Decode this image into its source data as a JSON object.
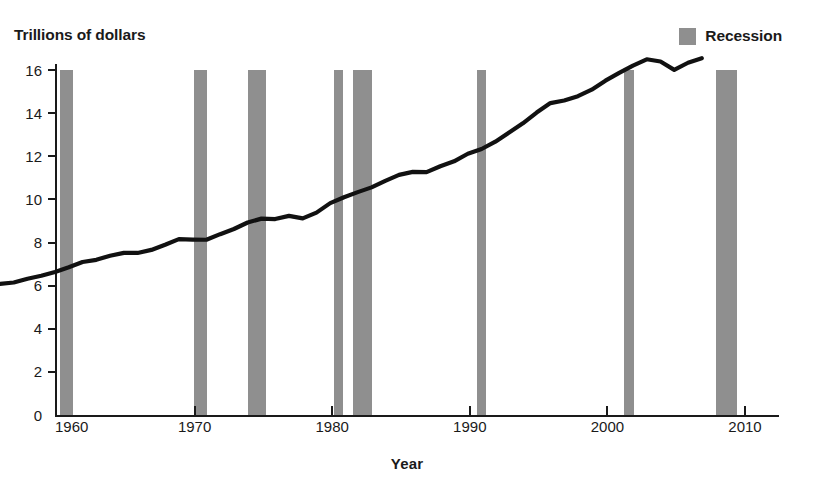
{
  "top_caption_sliver": "",
  "legend": {
    "items": [
      {
        "label": "Recession",
        "swatch_color": "#8f8f8f",
        "icon": "filled-square-icon"
      }
    ]
  },
  "axis_titles": {
    "y": "Trillions of dollars",
    "x": "Year"
  },
  "colors": {
    "line": "#111111",
    "recession": "#8f8f8f",
    "axis": "#1a1a1a",
    "background": "#ffffff"
  },
  "chart_data": {
    "type": "line",
    "title": "",
    "subtitle": "",
    "xlabel": "Year",
    "ylabel": "Trillions of dollars",
    "xlim": [
      1960,
      2011.5
    ],
    "ylim": [
      0,
      16
    ],
    "grid": false,
    "legend_position": "top-right",
    "x_ticks": [
      1960,
      1970,
      1980,
      1990,
      2000,
      2010
    ],
    "x_tick_labels": [
      "1960",
      "1970",
      "1980",
      "1990",
      "2000",
      "2010"
    ],
    "y_ticks": [
      0,
      2,
      4,
      6,
      8,
      10,
      12,
      14,
      16
    ],
    "y_tick_labels": [
      "0",
      "2",
      "4",
      "6",
      "8",
      "10",
      "12",
      "14",
      "16"
    ],
    "series": [
      {
        "name": "Real GDP",
        "x": [
          1960,
          1961,
          1962,
          1963,
          1964,
          1965,
          1966,
          1967,
          1968,
          1969,
          1970,
          1971,
          1972,
          1973,
          1974,
          1975,
          1976,
          1977,
          1978,
          1979,
          1980,
          1981,
          1982,
          1983,
          1984,
          1985,
          1986,
          1987,
          1988,
          1989,
          1990,
          1991,
          1992,
          1993,
          1994,
          1995,
          1996,
          1997,
          1998,
          1999,
          2000,
          2001,
          2002,
          2003,
          2004,
          2005,
          2006,
          2007,
          2008,
          2009,
          2010,
          2011
        ],
        "values": [
          2.83,
          2.9,
          3.07,
          3.21,
          3.39,
          3.61,
          3.85,
          3.95,
          4.14,
          4.27,
          4.27,
          4.41,
          4.65,
          4.91,
          4.89,
          4.88,
          5.14,
          5.38,
          5.68,
          5.86,
          5.84,
          5.99,
          5.87,
          6.14,
          6.58,
          6.85,
          7.09,
          7.31,
          7.61,
          7.89,
          8.03,
          8.02,
          8.29,
          8.52,
          8.87,
          9.09,
          9.43,
          9.85,
          10.28,
          10.78,
          11.22,
          11.34,
          11.54,
          11.84,
          12.26,
          12.62,
          12.96,
          13.25,
          13.15,
          12.76,
          13.09,
          13.3
        ]
      }
    ],
    "shaded_regions": {
      "label": "Recession",
      "color": "#8f8f8f",
      "spans": [
        [
          1960.25,
          1961.15
        ],
        [
          1969.95,
          1970.9
        ],
        [
          1973.9,
          1975.2
        ],
        [
          1980.15,
          1980.8
        ],
        [
          1981.5,
          1982.9
        ],
        [
          1990.55,
          1991.2
        ],
        [
          2001.2,
          2001.9
        ],
        [
          2007.9,
          2009.45
        ]
      ]
    }
  }
}
